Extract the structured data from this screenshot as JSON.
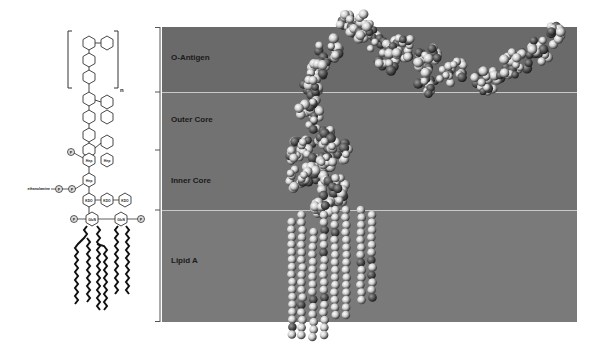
{
  "schematic": {
    "repeat_subscript": "n",
    "units": {
      "heptose": "Hep",
      "kdo": "KDO",
      "glucosamine": "GlcN",
      "phosphate": "P",
      "ethanolamine": "ethanolamine"
    }
  },
  "regions": [
    {
      "id": "o-antigen",
      "label": "O-Antigen"
    },
    {
      "id": "outer-core",
      "label": "Outer Core"
    },
    {
      "id": "inner-core",
      "label": "Inner Core"
    },
    {
      "id": "lipid-a",
      "label": "Lipid A"
    }
  ],
  "colors": {
    "panel_dark": "#6a6a6a",
    "panel_mid": "#727272",
    "panel_light": "#7a7a7a",
    "separator": "#c8c8c8",
    "atom_light": "#d8d8d8",
    "atom_dark": "#4a4a4a"
  }
}
